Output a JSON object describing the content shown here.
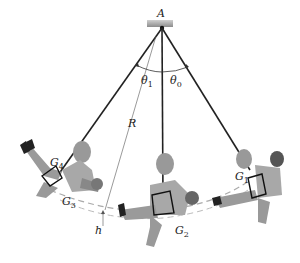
{
  "diagram": {
    "labels": {
      "pivot": "A",
      "theta1": "θ",
      "theta1_sub": "1",
      "theta0": "θ",
      "theta0_sub": "0",
      "radius": "R",
      "height": "h",
      "g1": "G",
      "g1_sub": "1",
      "g2": "G",
      "g2_sub": "2",
      "g3": "G",
      "g3_sub": "3",
      "g4": "G",
      "g4_sub": "4"
    },
    "colors": {
      "rope": "#222222",
      "support": "#9a9a9a",
      "path": "#b0b0b0",
      "skin": "#8a8a8a",
      "clothes": "#a8a8a8",
      "dark": "#333333"
    }
  }
}
